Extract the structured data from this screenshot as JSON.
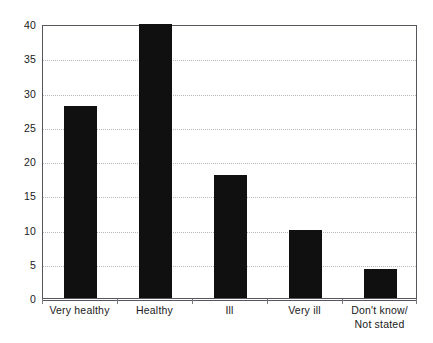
{
  "chart_data": {
    "type": "bar",
    "title": "",
    "subtitle": "",
    "xlabel": "",
    "ylabel": "",
    "categories": [
      "Very healthy",
      "Healthy",
      "Ill",
      "Very ill",
      "Don't know/\nNot stated"
    ],
    "category_lines": [
      [
        "Very healthy"
      ],
      [
        "Healthy"
      ],
      [
        "Ill"
      ],
      [
        "Very ill"
      ],
      [
        "Don't know/",
        "Not stated"
      ]
    ],
    "values": [
      28,
      40,
      18,
      10,
      4.3
    ],
    "ylim": [
      0,
      40
    ],
    "yticks": [
      0,
      5,
      10,
      15,
      20,
      25,
      30,
      35,
      40
    ],
    "ytick_labels": [
      "0",
      "5",
      "10",
      "15",
      "20",
      "25",
      "30",
      "35",
      "40"
    ],
    "grid": true,
    "grid_axis": "y",
    "legend": false,
    "legend_position": "none",
    "bar_color": "#101010",
    "grid_color": "#b9b9bd",
    "axis_color": "#56565c",
    "background_color": "#ffffff",
    "annotations": []
  }
}
